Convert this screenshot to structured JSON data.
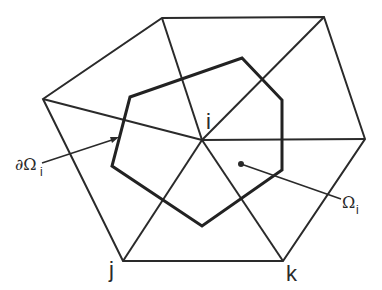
{
  "diagram": {
    "title": "",
    "colors": {
      "line": "#2a2a2a",
      "background": "#ffffff"
    },
    "nodes": {
      "center": {
        "label": "i",
        "x": 202,
        "y": 140
      },
      "j": {
        "label": "j",
        "x": 123,
        "y": 261
      },
      "k": {
        "label": "k",
        "x": 283,
        "y": 261
      }
    },
    "outer_vertices": [
      [
        43,
        99
      ],
      [
        162,
        18
      ],
      [
        324,
        17
      ],
      [
        365,
        139
      ],
      [
        283,
        261
      ],
      [
        123,
        261
      ]
    ],
    "control_volume_vertices": [
      [
        130,
        97
      ],
      [
        242,
        58
      ],
      [
        282,
        100
      ],
      [
        282,
        170
      ],
      [
        202,
        226
      ],
      [
        112,
        166
      ]
    ],
    "labels": {
      "node_i": "i",
      "node_j": "j",
      "node_k": "k",
      "boundary": {
        "symbol": "∂Ω",
        "subscript": "i"
      },
      "region": {
        "symbol": "Ω",
        "subscript": "i"
      }
    }
  }
}
